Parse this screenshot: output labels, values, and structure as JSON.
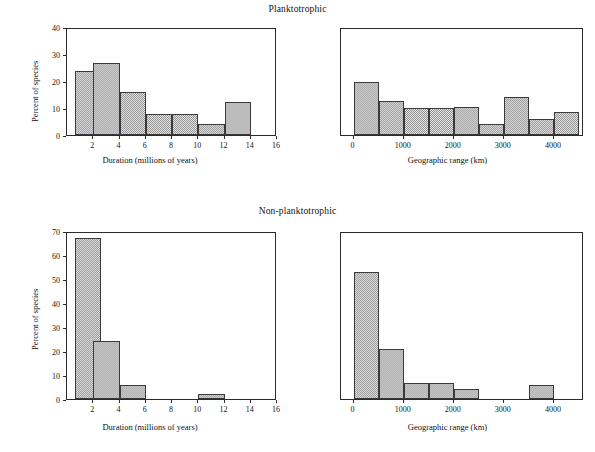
{
  "figure": {
    "background_color": "#ffffff",
    "bar_fill_color": "#cfcfcf",
    "bar_edge_color": "#3a3a3a",
    "axis_color": "#2b2b2b"
  },
  "groups": [
    {
      "id": "planktotrophic",
      "title": "Planktotrophic"
    },
    {
      "id": "non-planktotrophic",
      "title": "Non-planktotrophic"
    }
  ],
  "chart_data": [
    {
      "id": "planktotrophic-duration",
      "type": "bar",
      "title": "Planktotrophic",
      "xlabel": "Duration (millions of years)",
      "ylabel": "Percent of species",
      "xlim": [
        0,
        16
      ],
      "ylim": [
        0,
        40
      ],
      "xticks": [
        2,
        4,
        6,
        8,
        10,
        12,
        14,
        16
      ],
      "xtick_labels": [
        "2",
        "4",
        "6",
        "8",
        "10",
        "12",
        "14",
        "16"
      ],
      "yticks": [
        0,
        10,
        20,
        30,
        40
      ],
      "ytick_labels": [
        "0",
        "10",
        "20",
        "30",
        "40"
      ],
      "grid": false,
      "legend": "none",
      "bin_width": 2,
      "bin_starts": [
        0.6,
        2,
        4,
        6,
        8,
        10,
        12
      ],
      "values": [
        23.8,
        26.8,
        15.9,
        7.8,
        7.8,
        4.0,
        12.4
      ]
    },
    {
      "id": "planktotrophic-range",
      "type": "bar",
      "title": "Planktotrophic",
      "xlabel": "Geographic range (km)",
      "ylabel": "",
      "xlim": [
        -250,
        4600
      ],
      "ylim": [
        0,
        40
      ],
      "xticks": [
        0,
        1000,
        2000,
        3000,
        4000
      ],
      "xtick_labels": [
        "0",
        "1000",
        "2000",
        "3000",
        "4000"
      ],
      "yticks": [],
      "ytick_labels": [],
      "grid": false,
      "legend": "none",
      "bin_width": 500,
      "bin_starts": [
        0,
        500,
        1000,
        1500,
        2000,
        2500,
        3000,
        3500,
        4000
      ],
      "values": [
        19.5,
        12.5,
        10.0,
        10.0,
        10.5,
        4.0,
        14.0,
        6.0,
        8.5
      ]
    },
    {
      "id": "non-planktotrophic-duration",
      "type": "bar",
      "title": "Non-planktotrophic",
      "xlabel": "Duration (millions of years)",
      "ylabel": "Percent of species",
      "xlim": [
        0,
        16
      ],
      "ylim": [
        0,
        70
      ],
      "xticks": [
        2,
        4,
        6,
        8,
        10,
        12,
        14,
        16
      ],
      "xtick_labels": [
        "2",
        "4",
        "6",
        "8",
        "10",
        "12",
        "14",
        "16"
      ],
      "yticks": [
        0,
        10,
        20,
        30,
        40,
        50,
        60,
        70
      ],
      "ytick_labels": [
        "0",
        "10",
        "20",
        "30",
        "40",
        "50",
        "60",
        "70"
      ],
      "grid": false,
      "legend": "none",
      "bin_width": 2,
      "bin_starts": [
        0.6,
        2,
        4,
        10
      ],
      "values": [
        67.0,
        24.0,
        6.0,
        2.2
      ]
    },
    {
      "id": "non-planktotrophic-range",
      "type": "bar",
      "title": "Non-planktotrophic",
      "xlabel": "Geographic range (km)",
      "ylabel": "",
      "xlim": [
        -250,
        4600
      ],
      "ylim": [
        0,
        70
      ],
      "xticks": [
        0,
        1000,
        2000,
        3000,
        4000
      ],
      "xtick_labels": [
        "0",
        "1000",
        "2000",
        "3000",
        "4000"
      ],
      "yticks": [],
      "ytick_labels": [],
      "grid": false,
      "legend": "none",
      "bin_width": 500,
      "bin_starts": [
        0,
        500,
        1000,
        1500,
        2000,
        3500
      ],
      "values": [
        53.0,
        21.0,
        6.5,
        6.5,
        4.0,
        6.0
      ]
    }
  ]
}
